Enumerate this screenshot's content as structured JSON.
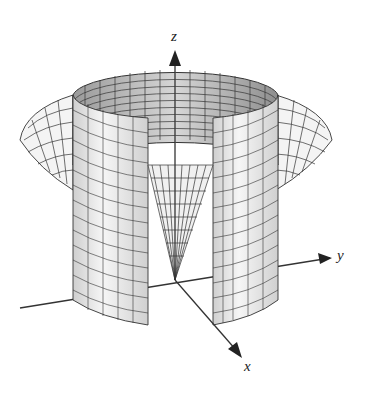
{
  "figure": {
    "axes": {
      "x_label": "x",
      "y_label": "y",
      "z_label": "z"
    },
    "colors": {
      "mesh_line": "#333333",
      "surface_light": "#f2f2f2",
      "surface_inner": "#c8c8c8",
      "axis": "#333333"
    }
  }
}
